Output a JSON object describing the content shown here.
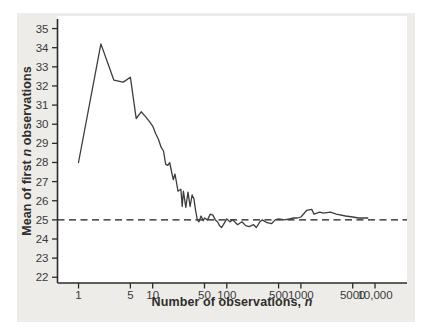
{
  "panel": {
    "background": "#edece8",
    "plot_background": "#ffffff"
  },
  "axes": {
    "y_title_prefix": "Mean of first ",
    "y_title_italic": "n",
    "y_title_suffix": " observations",
    "x_title_prefix": "Number of observations, ",
    "x_title_italic": "n"
  },
  "chart_data": {
    "type": "line",
    "x_scale": "log",
    "title": "",
    "xlabel": "Number of observations, n",
    "ylabel": "Mean of first n observations",
    "legend": "none",
    "grid": false,
    "x_ticks": [
      1,
      5,
      10,
      50,
      100,
      500,
      1000,
      5000,
      10000
    ],
    "x_tick_labels": [
      "1",
      "5",
      "10",
      "50",
      "100",
      "500",
      "1000",
      "5000",
      "10,000"
    ],
    "y_ticks": [
      22,
      23,
      24,
      25,
      26,
      27,
      28,
      29,
      30,
      31,
      32,
      33,
      34,
      35
    ],
    "xlim": [
      0.52,
      27000
    ],
    "ylim": [
      21.7,
      35.5
    ],
    "reference_line": {
      "y": 25,
      "style": "dashed"
    },
    "colors": {
      "line": "#3d3d3d",
      "reference": "#1a1a1a",
      "axis": "#2b2b2b",
      "tick_label": "#3a3a3a"
    },
    "series": [
      {
        "name": "Running mean of observations",
        "points": [
          [
            1,
            28.0
          ],
          [
            2,
            34.2
          ],
          [
            3,
            32.3
          ],
          [
            4,
            32.2
          ],
          [
            5,
            32.45
          ],
          [
            6,
            30.3
          ],
          [
            7,
            30.65
          ],
          [
            8,
            30.4
          ],
          [
            9,
            30.15
          ],
          [
            10,
            29.9
          ],
          [
            11,
            29.5
          ],
          [
            12,
            29.2
          ],
          [
            13,
            28.8
          ],
          [
            14,
            28.6
          ],
          [
            15,
            27.9
          ],
          [
            16,
            27.85
          ],
          [
            17,
            28.0
          ],
          [
            18,
            27.5
          ],
          [
            19,
            27.1
          ],
          [
            20,
            27.4
          ],
          [
            22,
            26.5
          ],
          [
            24,
            26.6
          ],
          [
            25,
            25.7
          ],
          [
            26,
            26.5
          ],
          [
            28,
            25.65
          ],
          [
            30,
            26.45
          ],
          [
            32,
            25.7
          ],
          [
            34,
            26.3
          ],
          [
            36,
            26.1
          ],
          [
            38,
            25.5
          ],
          [
            40,
            25.0
          ],
          [
            42,
            24.9
          ],
          [
            45,
            25.2
          ],
          [
            48,
            24.95
          ],
          [
            50,
            25.1
          ],
          [
            55,
            25.0
          ],
          [
            60,
            25.3
          ],
          [
            65,
            25.25
          ],
          [
            70,
            25.0
          ],
          [
            75,
            24.9
          ],
          [
            80,
            24.7
          ],
          [
            85,
            24.6
          ],
          [
            90,
            24.75
          ],
          [
            100,
            25.05
          ],
          [
            110,
            24.9
          ],
          [
            120,
            25.0
          ],
          [
            140,
            24.75
          ],
          [
            160,
            24.9
          ],
          [
            180,
            24.7
          ],
          [
            200,
            24.65
          ],
          [
            230,
            24.75
          ],
          [
            250,
            24.6
          ],
          [
            280,
            24.9
          ],
          [
            300,
            25.0
          ],
          [
            350,
            24.85
          ],
          [
            400,
            24.8
          ],
          [
            450,
            25.0
          ],
          [
            500,
            25.05
          ],
          [
            600,
            25.0
          ],
          [
            700,
            25.05
          ],
          [
            800,
            25.1
          ],
          [
            900,
            25.1
          ],
          [
            1000,
            25.15
          ],
          [
            1200,
            25.5
          ],
          [
            1400,
            25.55
          ],
          [
            1500,
            25.3
          ],
          [
            1800,
            25.4
          ],
          [
            2000,
            25.35
          ],
          [
            2500,
            25.4
          ],
          [
            3000,
            25.3
          ],
          [
            4000,
            25.2
          ],
          [
            5000,
            25.15
          ],
          [
            6000,
            25.1
          ],
          [
            8000,
            25.1
          ]
        ]
      }
    ]
  }
}
